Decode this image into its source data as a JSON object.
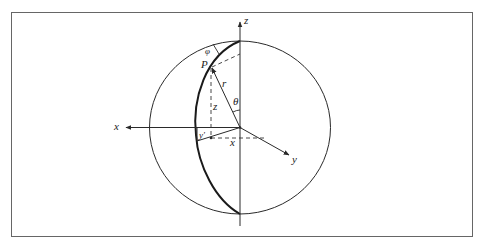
{
  "figure": {
    "colors": {
      "line": "#2a2a2a",
      "frame": "#555555",
      "background": "#ffffff"
    },
    "labels": {
      "z_axis": "z",
      "x_axis": "x",
      "y_axis": "y",
      "point": "P",
      "radius": "r",
      "polar_angle": "θ",
      "azimuth_angle": "φ",
      "z_component": "z",
      "x_component": "x",
      "y_component": "y'"
    }
  }
}
